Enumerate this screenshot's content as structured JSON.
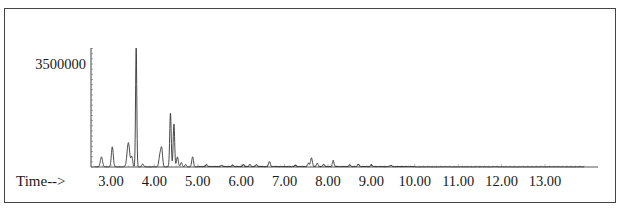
{
  "chart_data": {
    "type": "line",
    "title": "",
    "xlabel": "Time-->",
    "ylabel": "",
    "y_tick_labels": [
      "3500000"
    ],
    "y_tick_values": [
      3500000
    ],
    "x_tick_labels": [
      "3.00",
      "4.00",
      "5.00",
      "6.00",
      "7.00",
      "8.00",
      "9.00",
      "10.00",
      "11.00",
      "12.00",
      "13.00"
    ],
    "x_tick_values": [
      3,
      4,
      5,
      6,
      7,
      8,
      9,
      10,
      11,
      12,
      13
    ],
    "xlim": [
      2.55,
      13.95
    ],
    "ylim": [
      0,
      4100000
    ],
    "grid": false,
    "legend": "none",
    "series": [
      {
        "name": "TIC",
        "peaks": [
          {
            "t": 2.78,
            "abundance": 340000,
            "width": 0.025
          },
          {
            "t": 3.03,
            "abundance": 680000,
            "width": 0.022
          },
          {
            "t": 3.4,
            "abundance": 820000,
            "width": 0.03
          },
          {
            "t": 3.48,
            "abundance": 340000,
            "width": 0.02
          },
          {
            "t": 3.58,
            "abundance": 4040000,
            "width": 0.014
          },
          {
            "t": 3.73,
            "abundance": 100000,
            "width": 0.02
          },
          {
            "t": 4.13,
            "abundance": 420000,
            "width": 0.025
          },
          {
            "t": 4.17,
            "abundance": 540000,
            "width": 0.02
          },
          {
            "t": 4.37,
            "abundance": 1830000,
            "width": 0.017
          },
          {
            "t": 4.45,
            "abundance": 1460000,
            "width": 0.017
          },
          {
            "t": 4.53,
            "abundance": 340000,
            "width": 0.02
          },
          {
            "t": 4.62,
            "abundance": 150000,
            "width": 0.02
          },
          {
            "t": 4.72,
            "abundance": 80000,
            "width": 0.02
          },
          {
            "t": 4.88,
            "abundance": 340000,
            "width": 0.02
          },
          {
            "t": 5.2,
            "abundance": 70000,
            "width": 0.02
          },
          {
            "t": 5.55,
            "abundance": 50000,
            "width": 0.02
          },
          {
            "t": 5.8,
            "abundance": 50000,
            "width": 0.02
          },
          {
            "t": 6.05,
            "abundance": 60000,
            "width": 0.02
          },
          {
            "t": 6.2,
            "abundance": 70000,
            "width": 0.02
          },
          {
            "t": 6.35,
            "abundance": 60000,
            "width": 0.02
          },
          {
            "t": 6.65,
            "abundance": 170000,
            "width": 0.02
          },
          {
            "t": 7.25,
            "abundance": 50000,
            "width": 0.02
          },
          {
            "t": 7.55,
            "abundance": 120000,
            "width": 0.02
          },
          {
            "t": 7.62,
            "abundance": 300000,
            "width": 0.02
          },
          {
            "t": 7.75,
            "abundance": 110000,
            "width": 0.02
          },
          {
            "t": 7.9,
            "abundance": 80000,
            "width": 0.02
          },
          {
            "t": 8.12,
            "abundance": 200000,
            "width": 0.02
          },
          {
            "t": 8.5,
            "abundance": 60000,
            "width": 0.02
          },
          {
            "t": 8.7,
            "abundance": 70000,
            "width": 0.02
          },
          {
            "t": 9.0,
            "abundance": 60000,
            "width": 0.02
          },
          {
            "t": 9.45,
            "abundance": 40000,
            "width": 0.02
          }
        ]
      }
    ]
  }
}
